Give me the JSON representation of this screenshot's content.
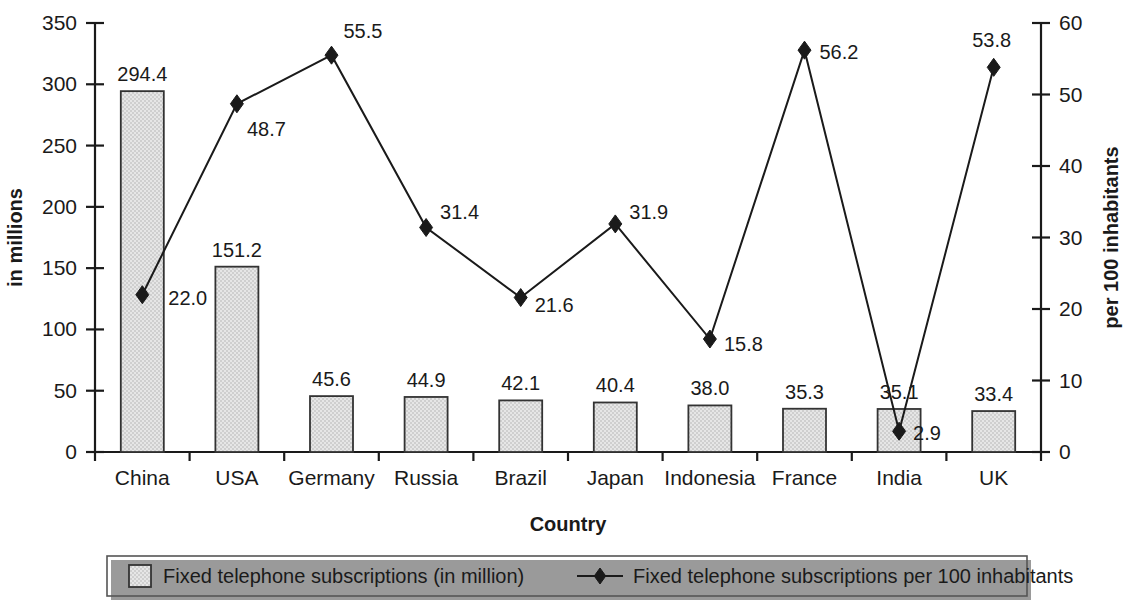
{
  "chart_data": {
    "type": "bar",
    "title": "",
    "xlabel": "Country",
    "ylabel": "in millions",
    "y2label": "per 100 inhabitants",
    "ylim": [
      0,
      350
    ],
    "y2lim": [
      0,
      60
    ],
    "grid": false,
    "legend_position": "bottom",
    "categories": [
      "China",
      "USA",
      "Germany",
      "Russia",
      "Brazil",
      "Japan",
      "Indonesia",
      "France",
      "India",
      "UK"
    ],
    "yticks": [
      "0",
      "50",
      "100",
      "150",
      "200",
      "250",
      "300",
      "350"
    ],
    "y2ticks": [
      "0",
      "10",
      "20",
      "30",
      "40",
      "50",
      "60"
    ],
    "series": [
      {
        "name": "Fixed telephone subscriptions (in million)",
        "type": "bar",
        "axis": "left",
        "values": [
          294.4,
          151.2,
          45.6,
          44.9,
          42.1,
          40.4,
          38.0,
          35.3,
          35.1,
          33.4
        ],
        "labels": [
          "294.4",
          "151.2",
          "45.6",
          "44.9",
          "42.1",
          "40.4",
          "38.0",
          "35.3",
          "35.1",
          "33.4"
        ]
      },
      {
        "name": "Fixed telephone subscriptions per 100 inhabitants",
        "type": "line",
        "axis": "right",
        "values": [
          22.0,
          48.7,
          55.5,
          31.4,
          21.6,
          31.9,
          15.8,
          56.2,
          2.9,
          53.8
        ],
        "labels": [
          "22.0",
          "48.7",
          "55.5",
          "31.4",
          "21.6",
          "31.9",
          "15.8",
          "56.2",
          "2.9",
          "53.8"
        ]
      }
    ]
  },
  "legend": {
    "items": [
      {
        "label": "Fixed telephone subscriptions (in million)",
        "marker": "filled-square-swatch"
      },
      {
        "label": "Fixed telephone subscriptions per 100 inhabitants",
        "marker": "line-diamond-marker"
      }
    ]
  },
  "colors": {
    "bar_fill": "#d9d9d9",
    "bar_stroke": "#333333",
    "line": "#1a1a1a",
    "marker": "#1a1a1a",
    "text": "#1a1a1a",
    "legend_border": "#555555"
  }
}
